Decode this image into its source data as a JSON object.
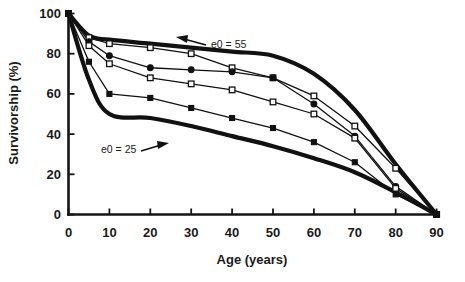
{
  "chart_data": {
    "type": "line",
    "title": "",
    "xlabel": "Age (years)",
    "ylabel": "Survivorship (%)",
    "xlim": [
      0,
      90
    ],
    "ylim": [
      0,
      100
    ],
    "xticks": [
      0,
      10,
      20,
      30,
      40,
      50,
      60,
      70,
      80,
      90
    ],
    "yticks": [
      0,
      20,
      40,
      60,
      80,
      100
    ],
    "grid": false,
    "legend": "none",
    "annotations": [
      {
        "text": "e0 = 55",
        "target_series": "upper-bound-e0-55",
        "arrow": "left"
      },
      {
        "text": "e0 = 25",
        "target_series": "lower-bound-e0-25",
        "arrow": "right"
      }
    ],
    "x": [
      0,
      5,
      10,
      20,
      30,
      40,
      50,
      60,
      70,
      80,
      90
    ],
    "series": [
      {
        "name": "upper-bound-e0-55",
        "marker": "none",
        "style": "thick",
        "values": [
          100,
          89,
          87,
          85,
          83,
          81,
          79,
          70,
          52,
          25,
          0
        ]
      },
      {
        "name": "series-open-square-upper",
        "marker": "open-square",
        "style": "thin",
        "values": [
          100,
          88,
          85,
          83,
          80,
          73,
          68,
          59,
          44,
          23,
          0
        ]
      },
      {
        "name": "series-filled-circle",
        "marker": "filled-circle",
        "style": "thin",
        "values": [
          100,
          86,
          79,
          73,
          72,
          71,
          68,
          55,
          39,
          14,
          0
        ]
      },
      {
        "name": "series-open-square-lower",
        "marker": "open-square",
        "style": "thin",
        "values": [
          100,
          84,
          75,
          68,
          65,
          62,
          56,
          50,
          38,
          13,
          0
        ]
      },
      {
        "name": "series-filled-square",
        "marker": "filled-square",
        "style": "thin",
        "values": [
          100,
          76,
          60,
          58,
          53,
          48,
          43,
          36,
          26,
          10,
          0
        ]
      },
      {
        "name": "lower-bound-e0-25",
        "marker": "none",
        "style": "thick",
        "values": [
          100,
          67,
          50,
          48,
          44,
          39,
          34,
          28,
          21,
          11,
          0
        ]
      }
    ]
  },
  "axis": {
    "x_title": "Age (years)",
    "y_title": "Survivorship (%)",
    "x_tick_labels": [
      "0",
      "10",
      "20",
      "30",
      "40",
      "50",
      "60",
      "70",
      "80",
      "90"
    ],
    "y_tick_labels": [
      "0",
      "20",
      "40",
      "60",
      "80",
      "100"
    ]
  },
  "annotations": {
    "upper": "e0 = 55",
    "lower": "e0 = 25"
  },
  "colors": {
    "ink": "#111111",
    "background": "#ffffff",
    "marker_fill_open": "#ffffff"
  }
}
